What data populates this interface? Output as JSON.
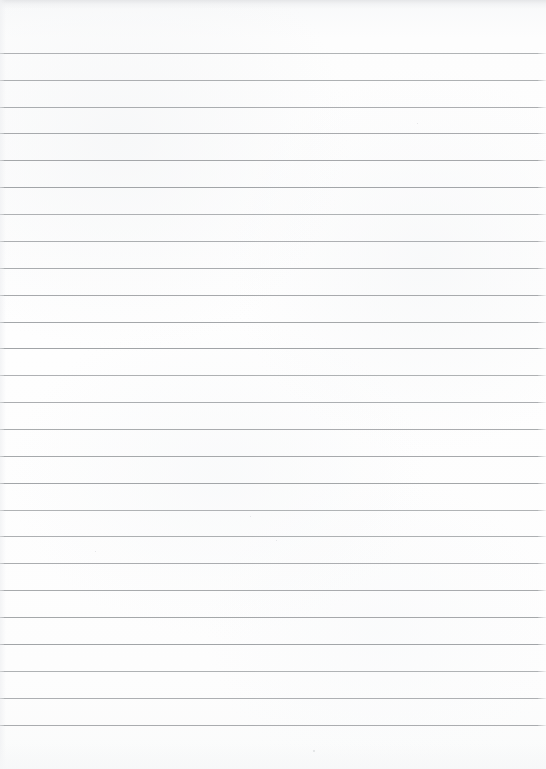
{
  "document": {
    "kind": "scanned-lined-paper",
    "title": "Blank lined notebook page",
    "page_width": 546,
    "page_height": 769,
    "text_content": "",
    "handwriting_present": "no",
    "printed_text_present": "no"
  },
  "colors": {
    "paper": "#fdfdfd",
    "paper_tint": "#f8f9fa",
    "rule_line": "#9ea1a4",
    "top_edge_band": "#e4e5e7",
    "speck": "#c9cbcd"
  },
  "ruling": {
    "orientation": "horizontal",
    "line_count": 26,
    "first_line_y": 53,
    "line_spacing": 26.9,
    "line_thickness": 1,
    "line_left_x": 4,
    "line_right_x": 538,
    "margin_rule_present": "no",
    "lines_y": [
      53,
      80,
      107,
      133,
      160,
      187,
      214,
      241,
      268,
      295,
      322,
      348,
      375,
      402,
      429,
      456,
      483,
      510,
      536,
      563,
      590,
      617,
      644,
      671,
      698,
      725
    ]
  },
  "margins": {
    "top": 53,
    "bottom": 44,
    "left": 4,
    "right": 8
  },
  "artifacts": {
    "specks": [
      {
        "x": 313,
        "y": 750,
        "size": 2
      },
      {
        "x": 417,
        "y": 123,
        "size": 1
      },
      {
        "x": 276,
        "y": 540,
        "size": 1
      },
      {
        "x": 95,
        "y": 551,
        "size": 1
      },
      {
        "x": 250,
        "y": 516,
        "size": 1
      }
    ]
  }
}
